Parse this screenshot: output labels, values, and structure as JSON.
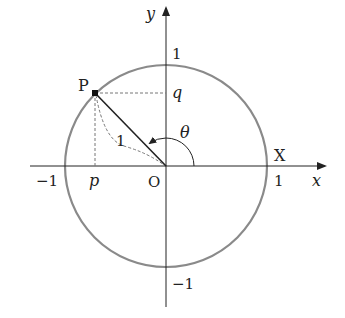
{
  "diagram": {
    "colors": {
      "axis": "#222222",
      "circle": "#8a8a8a",
      "segment": "#222222",
      "dashed": "#777777",
      "text": "#222222"
    },
    "axes": {
      "x_label": "x",
      "y_label": "y"
    },
    "ticks": {
      "x_pos": "1",
      "x_neg": "−1",
      "y_pos": "1",
      "y_neg": "−1"
    },
    "points": {
      "origin": "O",
      "P": "P",
      "X": "X"
    },
    "projections": {
      "p": "p",
      "q": "q"
    },
    "segment_label": "1",
    "angle_label": "θ"
  }
}
